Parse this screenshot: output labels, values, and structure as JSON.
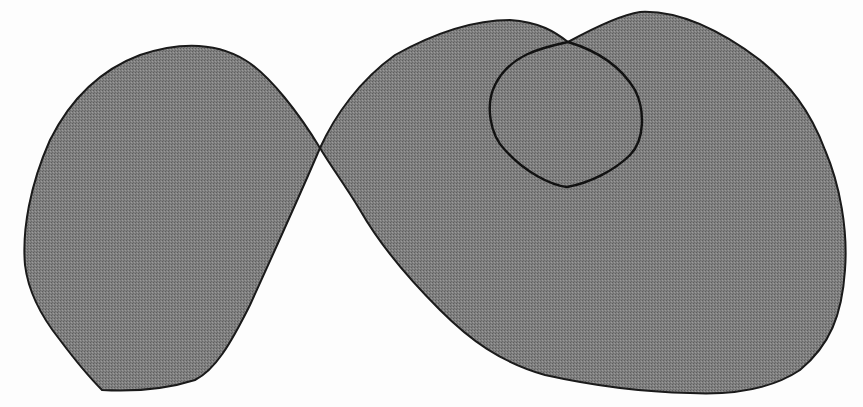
{
  "figure": {
    "width": 863,
    "height": 407,
    "background": "#fdfdfd",
    "fill_color": "#7a7a7a",
    "stroke_color": "#1a1a1a",
    "regions": [
      {
        "name": "left-lobe",
        "path": "M 320 148 C 300 115, 270 75, 245 60 C 220 45, 185 40, 140 55 C 100 70, 70 100, 50 140 C 30 185, 22 230, 25 265 C 28 290, 40 315, 60 340 C 75 360, 90 378, 102 390 C 140 392, 170 388, 195 380 C 215 370, 230 345, 250 305 C 275 250, 300 195, 320 148 Z"
      },
      {
        "name": "right-lobe",
        "path": "M 320 148 C 335 115, 360 80, 395 55 C 440 30, 480 20, 510 20 C 540 22, 555 32, 568 42 C 590 30, 620 15, 640 12 C 680 10, 720 30, 760 60 C 790 85, 810 110, 825 150 C 840 185, 848 230, 845 270 C 842 315, 830 345, 800 370 C 770 390, 730 395, 690 393 C 640 392, 590 385, 545 375 C 500 362, 470 340, 440 310 C 405 275, 380 245, 360 210 C 345 185, 330 165, 320 148 Z"
      }
    ],
    "outlines": [
      {
        "name": "inner-curve",
        "path": "M 568 42 C 540 48, 510 55, 495 85 C 485 105, 490 135, 505 150 C 525 172, 550 185, 567 187 C 590 183, 615 170, 630 155 C 645 140, 645 110, 635 90 C 620 65, 595 50, 568 42 Z"
      }
    ]
  }
}
